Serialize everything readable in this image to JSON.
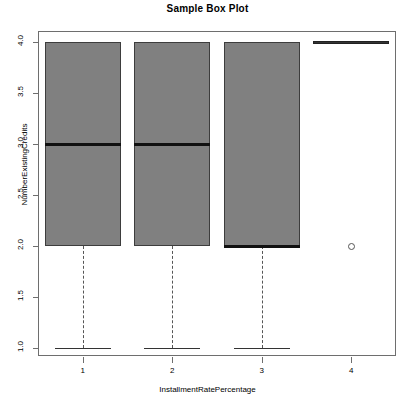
{
  "chart_data": {
    "type": "box",
    "title": "Sample Box Plot",
    "xlabel": "InstallmentRatePercentage",
    "ylabel": "NumberExistingCredits",
    "xlim": [
      0.5,
      4.5
    ],
    "ylim": [
      1.0,
      4.0
    ],
    "grid": false,
    "legend": null,
    "xticks": [
      "1",
      "2",
      "3",
      "4"
    ],
    "yticks": [
      "1.0",
      "1.5",
      "2.0",
      "2.5",
      "3.0",
      "3.5",
      "4.0"
    ],
    "ytick_values": [
      1.0,
      1.5,
      2.0,
      2.5,
      3.0,
      3.5,
      4.0
    ],
    "categories": [
      "1",
      "2",
      "3",
      "4"
    ],
    "boxes": [
      {
        "category": "1",
        "whisker_low": 1.0,
        "q1": 2.0,
        "median": 3.0,
        "q3": 4.0,
        "whisker_high": 4.0,
        "outliers": []
      },
      {
        "category": "2",
        "whisker_low": 1.0,
        "q1": 2.0,
        "median": 3.0,
        "q3": 4.0,
        "whisker_high": 4.0,
        "outliers": []
      },
      {
        "category": "3",
        "whisker_low": 1.0,
        "q1": 2.0,
        "median": 2.0,
        "q3": 4.0,
        "whisker_high": 4.0,
        "outliers": []
      },
      {
        "category": "4",
        "whisker_low": 4.0,
        "q1": 4.0,
        "median": 4.0,
        "q3": 4.0,
        "whisker_high": 4.0,
        "outliers": [
          2.0
        ]
      }
    ],
    "colors": {
      "box_fill": "#808080",
      "box_border": "#3d3d3d",
      "median": "#111111",
      "axis": "#6e6e6e"
    }
  }
}
